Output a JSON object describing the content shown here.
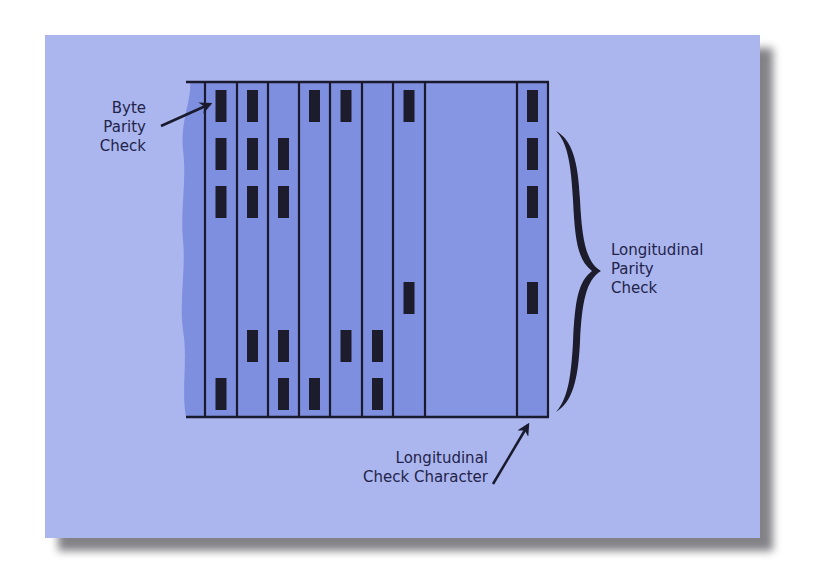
{
  "colors": {
    "page_background": "#ffffff",
    "card_background": "#abb6ee",
    "card_shadow": "#6d6d72",
    "tape_fill": "#7f8fe0",
    "tape_wide_column_fill": "#8796e2",
    "tape_edge_fill": "#7385dc",
    "line_color": "#1a1a2e",
    "bit_color": "#1c1c2c",
    "text_color": "#23234a"
  },
  "diagram": {
    "tape": {
      "left_edge_x": 183,
      "top_y": 82,
      "bottom_y": 417,
      "column_lines_x": [
        205,
        237,
        268,
        299,
        330,
        362,
        393,
        425,
        517,
        548
      ]
    },
    "rows_y": [
      90,
      138,
      186,
      282,
      330,
      378
    ],
    "bit_height": 32,
    "bit_width": 11,
    "columns": [
      {
        "index": 1,
        "role": "data byte",
        "bits": [
          1,
          1,
          1,
          0,
          0,
          1
        ]
      },
      {
        "index": 2,
        "role": "data byte",
        "bits": [
          1,
          1,
          1,
          0,
          1,
          0
        ]
      },
      {
        "index": 3,
        "role": "data byte",
        "bits": [
          0,
          1,
          1,
          0,
          1,
          1
        ]
      },
      {
        "index": 4,
        "role": "data byte",
        "bits": [
          1,
          0,
          0,
          0,
          0,
          1
        ]
      },
      {
        "index": 5,
        "role": "data byte",
        "bits": [
          1,
          0,
          0,
          0,
          1,
          0
        ]
      },
      {
        "index": 6,
        "role": "data byte",
        "bits": [
          0,
          0,
          0,
          0,
          1,
          1
        ]
      },
      {
        "index": 7,
        "role": "data byte",
        "bits": [
          1,
          0,
          0,
          1,
          0,
          0
        ]
      },
      {
        "index": 8,
        "role": "gap",
        "bits": [
          0,
          0,
          0,
          0,
          0,
          0
        ]
      },
      {
        "index": 9,
        "role": "longitudinal check character",
        "bits": [
          1,
          1,
          1,
          1,
          0,
          0
        ]
      }
    ],
    "labels": {
      "byte_parity": {
        "lines": [
          "Byte",
          "Parity",
          "Check"
        ]
      },
      "longitudinal_parity": {
        "lines": [
          "Longitudinal",
          "Parity",
          "Check"
        ]
      },
      "check_character": {
        "lines": [
          "Longitudinal",
          "Check Character"
        ]
      }
    },
    "arrows": [
      {
        "name": "byte-parity-arrow",
        "from": [
          161,
          126
        ],
        "to": [
          210,
          104
        ]
      },
      {
        "name": "check-character-arrow",
        "from": [
          493,
          484
        ],
        "to": [
          528,
          425
        ]
      }
    ],
    "brace": {
      "name": "longitudinal-parity-brace",
      "x": 556,
      "top_y": 131,
      "bottom_y": 412,
      "tip_x": 601,
      "tip_y": 271
    }
  }
}
